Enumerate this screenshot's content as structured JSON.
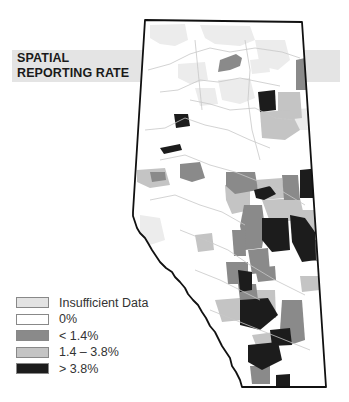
{
  "title": {
    "line1": "SPATIAL",
    "line2": "REPORTING RATE"
  },
  "map": {
    "region": "Alberta",
    "outline_color": "#111111",
    "river_color": "#c8c8c8"
  },
  "legend": {
    "items": [
      {
        "label": "Insufficient Data",
        "color": "#e3e3e3"
      },
      {
        "label": "0%",
        "color": "#ffffff"
      },
      {
        "label": "< 1.4%",
        "color": "#8a8a8a"
      },
      {
        "label": "1.4 – 3.8%",
        "color": "#c4c4c4"
      },
      {
        "label": "> 3.8%",
        "color": "#1c1c1c"
      }
    ]
  },
  "colors": {
    "banner": "#e4e4e4",
    "insufficient": "#e3e3e3",
    "zero": "#ffffff",
    "low": "#8a8a8a",
    "mid": "#c4c4c4",
    "high": "#1c1c1c"
  }
}
